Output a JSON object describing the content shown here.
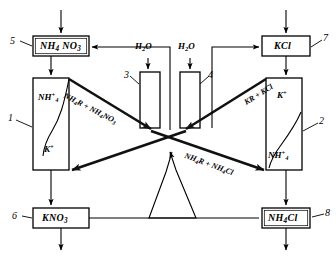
{
  "diagram": {
    "type": "process-flow",
    "boxes": [
      {
        "id": "5",
        "ref": "5",
        "formula_html": "NH<span class=\"sub\">4</span> NO<span class=\"sub\">3</span>",
        "plain": "NH4 NO3",
        "x": 33,
        "y": 36,
        "w": 56,
        "h": 20
      },
      {
        "id": "7",
        "ref": "7",
        "formula_html": "KCl",
        "plain": "KCl",
        "x": 262,
        "y": 36,
        "w": 48,
        "h": 20
      },
      {
        "id": "6",
        "ref": "6",
        "formula_html": "KNO<span class=\"sub\">3</span>",
        "plain": "KNO3",
        "x": 33,
        "y": 208,
        "w": 56,
        "h": 20
      },
      {
        "id": "8",
        "ref": "8",
        "formula_html": "NH<span class=\"sub\">4</span>Cl",
        "plain": "NH4Cl",
        "x": 262,
        "y": 208,
        "w": 48,
        "h": 20
      }
    ],
    "columns": [
      {
        "id": "1",
        "ref": "1",
        "x": 33,
        "y": 78,
        "w": 36,
        "h": 92,
        "top_label_html": "NH<span class=\"sup\">+</span><span class=\"sub\">4</span>",
        "top_label_plain": "NH4+",
        "bottom_label_html": "K<span class=\"sup\">+</span>",
        "bottom_label_plain": "K+"
      },
      {
        "id": "3",
        "ref": "3",
        "x": 140,
        "y": 72,
        "w": 20,
        "h": 56,
        "top_label_html": "",
        "top_label_plain": "",
        "bottom_label_html": "",
        "bottom_label_plain": ""
      },
      {
        "id": "4",
        "ref": "4",
        "x": 180,
        "y": 72,
        "w": 20,
        "h": 56,
        "top_label_html": "",
        "top_label_plain": "",
        "bottom_label_html": "",
        "bottom_label_plain": ""
      },
      {
        "id": "2",
        "ref": "2",
        "x": 266,
        "y": 78,
        "w": 36,
        "h": 92,
        "top_label_html": "K<span class=\"sup\">+</span>",
        "top_label_plain": "K+",
        "bottom_label_html": "NH<span class=\"sup\">+</span><span class=\"sub\">4</span>",
        "bottom_label_plain": "NH4+"
      }
    ],
    "water_inlets": [
      {
        "label_html": "H<span class=\"sub\">2</span>O",
        "label_plain": "H2O",
        "x": 135,
        "y": 46
      },
      {
        "label_html": "H<span class=\"sub\">2</span>O",
        "label_plain": "H2O",
        "x": 178,
        "y": 46
      }
    ],
    "stream_labels": [
      {
        "id": "s1",
        "html": "NH<span class=\"sub\">4</span>R + NH<span class=\"sub\">4</span>NO<span class=\"sub\">3</span>",
        "plain": "NH4R + NH4NO3",
        "x": 66,
        "y": 92,
        "angle": 27
      },
      {
        "id": "s2",
        "html": "KR + KCl",
        "plain": "KR + KCl",
        "x": 243,
        "y": 100,
        "angle": 35
      },
      {
        "id": "s3",
        "html": "NH<span class=\"sub\">4</span>R + NH<span class=\"sub\">4</span>Cl",
        "plain": "NH4R + NH4Cl",
        "x": 186,
        "y": 152,
        "angle": 22
      }
    ],
    "reference_numbers": [
      "1",
      "2",
      "3",
      "4",
      "5",
      "6",
      "7",
      "8"
    ],
    "colors": {
      "stroke": "#000000",
      "background": "#ffffff",
      "thick_stream": "#1a1a1a"
    }
  }
}
